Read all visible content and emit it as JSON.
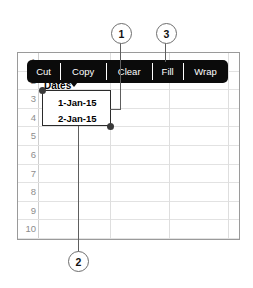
{
  "app": {
    "type": "spreadsheet-cell-context-menu",
    "description": "Spreadsheet grid with a selected cell range and a black context toolbar, annotated with numbered callouts"
  },
  "toolbar": {
    "name": "cell-context-toolbar",
    "background_color": "#0b0b0b",
    "text_color": "#ffffff",
    "items": [
      {
        "label": "Cut",
        "name": "cut"
      },
      {
        "label": "Copy",
        "name": "copy"
      },
      {
        "label": "Clear",
        "name": "clear"
      },
      {
        "label": "Fill",
        "name": "fill"
      },
      {
        "label": "Wrap",
        "name": "wrap"
      }
    ]
  },
  "sheet": {
    "row_numbers": [
      "1",
      "2",
      "3",
      "4",
      "5",
      "6",
      "7",
      "8",
      "9",
      "10"
    ],
    "cells": {
      "header": "Dates",
      "value_row2": "1-Jan-15",
      "value_row3": "2-Jan-15"
    },
    "selection": {
      "name": "selected-range",
      "range_label": "1-Jan-15 : 2-Jan-15",
      "handle_color": "#3a3a3a",
      "border_color": "#2b2b2b"
    },
    "grid_color": "#e2e2e2",
    "frame_color": "#9a9a9a"
  },
  "callouts": [
    {
      "number": "1",
      "name": "callout-1",
      "points_to": "selection-right-edge"
    },
    {
      "number": "2",
      "name": "callout-2",
      "points_to": "selection-bottom-handle"
    },
    {
      "number": "3",
      "name": "callout-3",
      "points_to": "fill-menu-item"
    }
  ]
}
